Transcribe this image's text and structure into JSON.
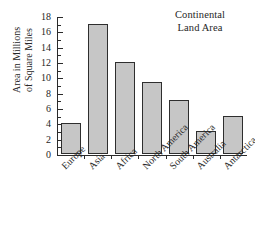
{
  "chart_data": {
    "type": "bar",
    "title": "Continental Land Area",
    "title_lines": [
      "Continental",
      "Land Area"
    ],
    "xlabel": "",
    "ylabel": "Area in Millions of Square Miles",
    "ylabel_lines": [
      "Area in Millions",
      "of Square Miles"
    ],
    "categories": [
      "Europe",
      "Asia",
      "Africa",
      "North America",
      "South America",
      "Australia",
      "Antarctica"
    ],
    "values": [
      4,
      17,
      12,
      9.4,
      7,
      3,
      5
    ],
    "ylim": [
      0,
      18
    ],
    "ytick_step": 2,
    "yticks": [
      0,
      2,
      4,
      6,
      8,
      10,
      12,
      14,
      16,
      18
    ],
    "minor_tick_step": 1,
    "grid": false,
    "legend": false,
    "bar_fill": "#c6c6c6",
    "bar_edge": "#2e2e2e",
    "axis_color": "#2b2b2b",
    "background": "#ffffff"
  }
}
